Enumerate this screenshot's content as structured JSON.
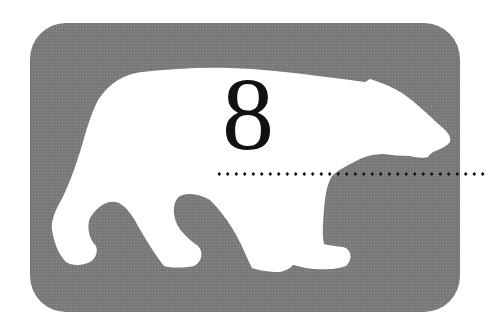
{
  "chapter": {
    "number": "8",
    "emblem": "polar-bear-silhouette",
    "rule_style": "dotted"
  },
  "colors": {
    "badge_fill": "#7b7b7b",
    "silhouette_fill": "#ffffff",
    "number_color": "#111111",
    "rule_color": "#1a1a1a",
    "page_background": "#ffffff"
  }
}
